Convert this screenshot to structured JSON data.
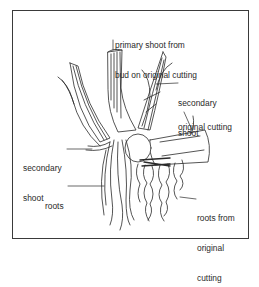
{
  "diagram": {
    "type": "labelled botanical illustration",
    "labels": {
      "primary_shoot_line1": "primary shoot from",
      "primary_shoot_line2": "bud on original cutting",
      "secondary_shoot_right_line1": "secondary",
      "secondary_shoot_right_line2": "shoot",
      "original_cutting": "original cutting",
      "secondary_shoot_left_line1": "secondary",
      "secondary_shoot_left_line2": "shoot",
      "roots": "roots",
      "roots_from_original_line1": "roots from",
      "roots_from_original_line2": "original",
      "roots_from_original_line3": "cutting"
    },
    "colors": {
      "ink": "#2a2a2a",
      "frame": "#3a3a3a",
      "background": "#ffffff"
    }
  }
}
